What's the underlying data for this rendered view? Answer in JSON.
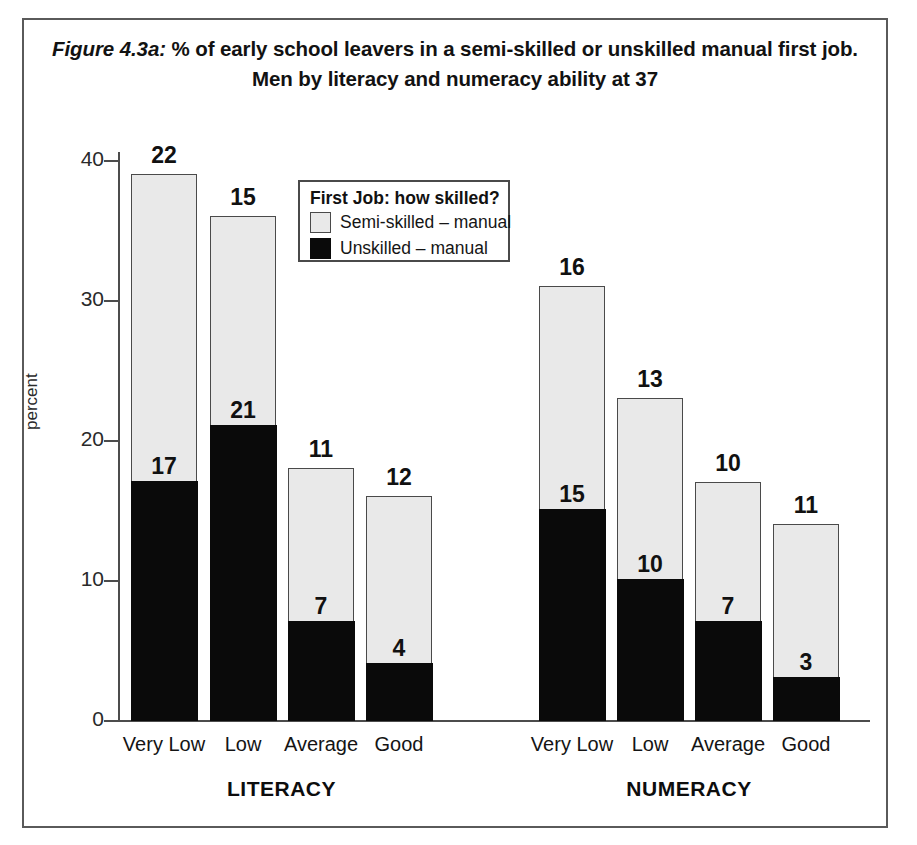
{
  "figure": {
    "label": "Figure 4.3a:",
    "title_line_1": " % of early school leavers in a semi-skilled or unskilled manual first job.",
    "title_line_2": "Men by literacy and numeracy ability at 37"
  },
  "legend": {
    "title": "First Job: how skilled?",
    "items": [
      {
        "label": "Semi-skilled – manual",
        "color": "#e9e9e9",
        "key": "semi_skilled"
      },
      {
        "label": "Unskilled – manual",
        "color": "#0a0a0a",
        "key": "unskilled"
      }
    ]
  },
  "axes": {
    "y_title": "percent",
    "y_ticks": [
      "0",
      "10",
      "20",
      "30",
      "40"
    ]
  },
  "groups": [
    {
      "name": "LITERACY"
    },
    {
      "name": "NUMERACY"
    }
  ],
  "chart_data": {
    "type": "bar",
    "subtype": "stacked",
    "title": "Figure 4.3a: % of early school leavers in a semi-skilled or unskilled manual first job. Men by literacy and numeracy ability at 37",
    "xlabel": "",
    "ylabel": "percent",
    "ylim": [
      0,
      40
    ],
    "yticks": [
      0,
      10,
      20,
      30,
      40
    ],
    "grid": false,
    "legend_position": "inside-top-center",
    "groups": [
      "LITERACY",
      "NUMERACY"
    ],
    "categories": [
      "Very Low",
      "Low",
      "Average",
      "Good"
    ],
    "series": [
      {
        "name": "Unskilled – manual",
        "color": "#0a0a0a",
        "values": {
          "LITERACY": [
            17,
            21,
            7,
            4
          ],
          "NUMERACY": [
            15,
            10,
            7,
            3
          ]
        }
      },
      {
        "name": "Semi-skilled – manual",
        "color": "#e9e9e9",
        "values": {
          "LITERACY": [
            22,
            15,
            11,
            12
          ],
          "NUMERACY": [
            16,
            13,
            10,
            11
          ]
        }
      }
    ],
    "totals": {
      "LITERACY": [
        39,
        36,
        18,
        16
      ],
      "NUMERACY": [
        31,
        23,
        17,
        14
      ]
    }
  },
  "bars": [
    {
      "group": "LITERACY",
      "category": "Very Low",
      "unskilled": 17,
      "semi_skilled": 22,
      "total": 39,
      "x": 131,
      "w": 66
    },
    {
      "group": "LITERACY",
      "category": "Low",
      "unskilled": 21,
      "semi_skilled": 15,
      "total": 36,
      "x": 210,
      "w": 66
    },
    {
      "group": "LITERACY",
      "category": "Average",
      "unskilled": 7,
      "semi_skilled": 11,
      "total": 18,
      "x": 288,
      "w": 66
    },
    {
      "group": "LITERACY",
      "category": "Good",
      "unskilled": 4,
      "semi_skilled": 12,
      "total": 16,
      "x": 366,
      "w": 66
    },
    {
      "group": "NUMERACY",
      "category": "Very Low",
      "unskilled": 15,
      "semi_skilled": 16,
      "total": 31,
      "x": 539,
      "w": 66
    },
    {
      "group": "NUMERACY",
      "category": "Low",
      "unskilled": 10,
      "semi_skilled": 13,
      "total": 23,
      "x": 617,
      "w": 66
    },
    {
      "group": "NUMERACY",
      "category": "Average",
      "unskilled": 7,
      "semi_skilled": 10,
      "total": 17,
      "x": 695,
      "w": 66
    },
    {
      "group": "NUMERACY",
      "category": "Good",
      "unskilled": 3,
      "semi_skilled": 11,
      "total": 14,
      "x": 773,
      "w": 66
    }
  ]
}
